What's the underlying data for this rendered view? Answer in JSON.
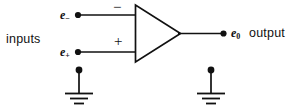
{
  "diagram": {
    "type": "circuit-schematic",
    "stroke_color": "#111111",
    "background_color": "#ffffff",
    "labels": {
      "inputs": "inputs",
      "inverting_input": "e",
      "inverting_input_sub": "−",
      "noninverting_input": "e",
      "noninverting_input_sub": "+",
      "output_var": "e",
      "output_var_sub": "0",
      "output": "output",
      "minus_terminal": "−",
      "plus_terminal": "+"
    },
    "components": {
      "amplifier": {
        "name": "triangle-amplifier",
        "apex_x": 180,
        "apex_y": 33,
        "left_x": 135,
        "top_y": 5,
        "bottom_y": 62
      },
      "nodes": [
        {
          "name": "inverting-input-node",
          "x": 78,
          "y": 15
        },
        {
          "name": "noninverting-input-node",
          "x": 78,
          "y": 52
        },
        {
          "name": "output-node",
          "x": 223,
          "y": 33
        },
        {
          "name": "input-ground-node",
          "x": 79,
          "y": 70
        },
        {
          "name": "output-ground-node",
          "x": 211,
          "y": 70
        }
      ],
      "wires": [
        {
          "name": "inverting-input-wire",
          "x1": 78,
          "y1": 15,
          "x2": 135,
          "y2": 15
        },
        {
          "name": "noninverting-input-wire",
          "x1": 78,
          "y1": 52,
          "x2": 135,
          "y2": 52
        },
        {
          "name": "output-wire",
          "x1": 180,
          "y1": 33,
          "x2": 223,
          "y2": 33
        },
        {
          "name": "input-ground-stem",
          "x1": 79,
          "y1": 70,
          "x2": 79,
          "y2": 93
        },
        {
          "name": "output-ground-stem",
          "x1": 211,
          "y1": 70,
          "x2": 211,
          "y2": 93
        }
      ],
      "grounds": [
        {
          "name": "input-ground-symbol",
          "x": 79,
          "y": 93
        },
        {
          "name": "output-ground-symbol",
          "x": 211,
          "y": 93
        }
      ]
    }
  }
}
